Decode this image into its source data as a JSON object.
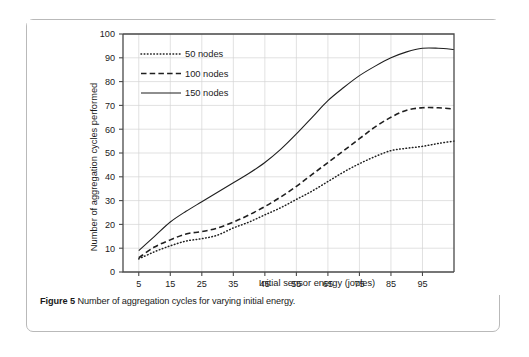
{
  "figure": {
    "caption_label": "Figure 5",
    "caption_text": "Number of aggregation cycles for varying initial energy."
  },
  "chart_data": {
    "type": "line",
    "title": "",
    "xlabel": "Initial sensor energy (joules)",
    "ylabel": "Number of aggregation cycles performed",
    "xlim": [
      0,
      105
    ],
    "ylim": [
      0,
      100
    ],
    "xticks": [
      5,
      15,
      25,
      35,
      45,
      55,
      65,
      75,
      85,
      95
    ],
    "yticks": [
      0,
      10,
      20,
      30,
      40,
      50,
      60,
      70,
      80,
      90,
      100
    ],
    "grid": true,
    "legend_position": "top-left",
    "x": [
      5,
      10,
      15,
      20,
      25,
      30,
      35,
      40,
      45,
      50,
      55,
      60,
      65,
      70,
      75,
      80,
      85,
      90,
      95,
      100,
      105
    ],
    "series": [
      {
        "name": "50 nodes",
        "style": "dotted",
        "color": "#1f1f1f",
        "values": [
          5.5,
          8.5,
          11,
          13,
          14,
          15.5,
          18.5,
          21,
          24,
          27,
          30.5,
          34,
          38,
          42,
          45.5,
          48.5,
          51,
          52,
          52.8,
          54,
          55
        ]
      },
      {
        "name": "100 nodes",
        "style": "dashed",
        "color": "#1f1f1f",
        "values": [
          6,
          10.5,
          13.5,
          16,
          17,
          18.5,
          21,
          24,
          27.5,
          31.5,
          36,
          41,
          46,
          51,
          56,
          61,
          65,
          68,
          69,
          69,
          68.5
        ]
      },
      {
        "name": "150 nodes",
        "style": "solid",
        "color": "#1f1f1f",
        "values": [
          9,
          15,
          21,
          25.5,
          29.5,
          33.5,
          37.5,
          41.5,
          46,
          51.5,
          58,
          65,
          72,
          77.5,
          82.5,
          86.5,
          90,
          92.5,
          94,
          94,
          93.5
        ]
      }
    ]
  }
}
